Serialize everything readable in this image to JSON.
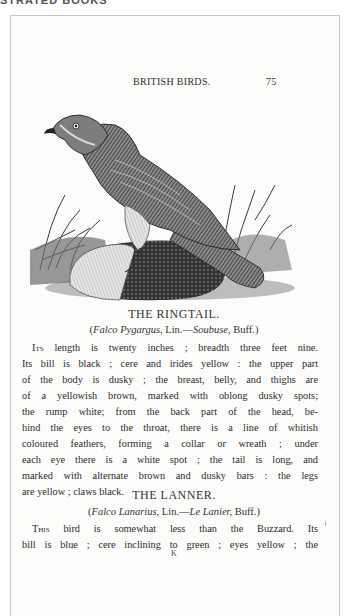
{
  "top_cutoff_text": "STRATED BOOKS",
  "running_head": {
    "title": "BRITISH BIRDS.",
    "page_number": "75"
  },
  "plate": {
    "subject": "Ringtail harrier perched on a rock with grasses, wood engraving",
    "icon": "bird-engraving"
  },
  "sections": [
    {
      "title": "THE RINGTAIL.",
      "synonyms": {
        "latin": "Falco Pygargus,",
        "auth1": " Lin.—",
        "french": "Soubuse,",
        "auth2": " Buff.)",
        "open": "("
      },
      "lines": [
        "length is twenty inches ; breadth three feet nine.",
        "Its bill is black ; cere and irides yellow : the upper part",
        "of the body is dusky ; the breast, belly, and thighs are",
        "of a yellowish brown, marked with oblong dusky spots;",
        "the rump white; from the back part of the head, be-",
        "hind the eyes to the throat, there is a line of whitish",
        "coloured feathers, forming a collar or wreath ; under",
        "each eye there is a white spot ; the tail is long, and",
        "marked with alternate brown and dusky bars : the legs",
        "are yellow ; claws black."
      ],
      "dropcap": "Its"
    },
    {
      "title": "THE LANNER.",
      "synonyms": {
        "latin": "Falco Lanarius,",
        "auth1": " Lin.—",
        "french": "Le Lanier,",
        "auth2": " Buff.)",
        "open": "("
      },
      "lines": [
        "bird is somewhat less than the Buzzard.  Its",
        "bill is blue ; cere inclining to green ; eyes yellow ; the"
      ],
      "dropcap": "This"
    }
  ],
  "signature_mark": "K",
  "colors": {
    "page": "#fcfcfb",
    "ink": "#2b2b2b",
    "frame": "#c4c4c4"
  }
}
